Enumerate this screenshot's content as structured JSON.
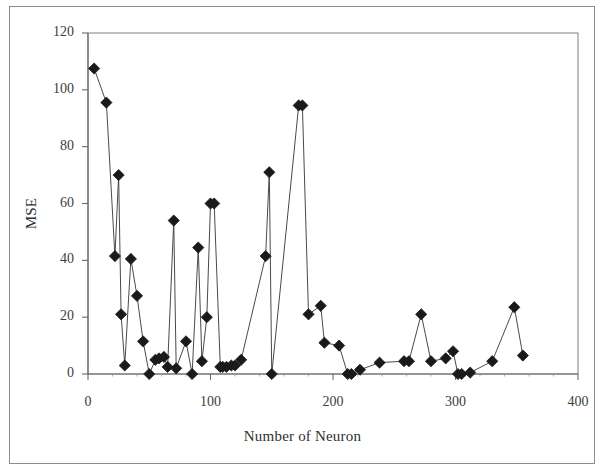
{
  "figure": {
    "background_color": "#ffffff",
    "frame_color": "#8d8d8d",
    "ink_color": "#1a1a1a"
  },
  "chart_data": {
    "type": "scatter",
    "title": "",
    "subtitle": "",
    "xlabel": "Number of Neuron",
    "ylabel": "MSE",
    "xlim": [
      0,
      400
    ],
    "ylim": [
      0,
      120
    ],
    "xticks": [
      0,
      100,
      200,
      300,
      400
    ],
    "yticks": [
      0,
      20,
      40,
      60,
      80,
      100,
      120
    ],
    "xtick_labels": [
      "0",
      "100",
      "200",
      "300",
      "400"
    ],
    "ytick_labels": [
      "0",
      "20",
      "40",
      "60",
      "80",
      "100",
      "120"
    ],
    "grid": false,
    "legend": false,
    "legend_position": "none",
    "marker": "diamond",
    "marker_color": "#1a1a1a",
    "line_color": "#4a4a4a",
    "series": [
      {
        "name": "MSE vs Number of Neuron",
        "x": [
          5,
          15,
          22,
          25,
          27,
          30,
          35,
          40,
          45,
          50,
          55,
          58,
          62,
          65,
          70,
          72,
          80,
          85,
          90,
          93,
          97,
          100,
          103,
          108,
          110,
          113,
          117,
          120,
          125,
          145,
          148,
          150,
          172,
          175,
          180,
          190,
          193,
          205,
          212,
          215,
          222,
          238,
          258,
          262,
          272,
          280,
          292,
          298,
          302,
          305,
          312,
          330,
          348,
          355
        ],
        "y": [
          107.5,
          95.5,
          41.5,
          70.0,
          21.0,
          3.0,
          40.5,
          27.5,
          11.5,
          0.0,
          5.0,
          5.5,
          6.0,
          2.5,
          54.0,
          2.0,
          11.5,
          0.0,
          44.5,
          4.5,
          20.0,
          60.0,
          60.0,
          2.5,
          2.5,
          2.5,
          3.0,
          3.0,
          5.0,
          41.5,
          71.0,
          0.0,
          94.5,
          94.5,
          21.0,
          24.0,
          11.0,
          10.0,
          0.0,
          0.0,
          1.5,
          4.0,
          4.5,
          4.5,
          21.0,
          4.5,
          5.5,
          8.0,
          0.0,
          0.0,
          0.5,
          4.5,
          23.5,
          6.5
        ]
      }
    ]
  }
}
